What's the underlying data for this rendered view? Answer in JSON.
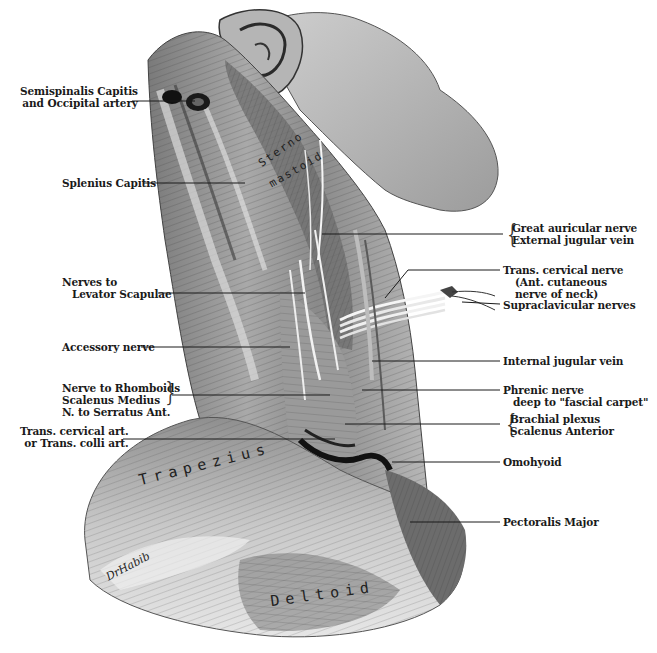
{
  "figure": {
    "signature": "DrHabib"
  },
  "left_labels": [
    {
      "id": "semispinalis",
      "lines": [
        "Semispinalis Capitis",
        "and Occipital artery"
      ]
    },
    {
      "id": "splenius",
      "lines": [
        "Splenius Capitis"
      ]
    },
    {
      "id": "levator-nerves",
      "lines": [
        "Nerves to",
        "Levator Scapulae"
      ]
    },
    {
      "id": "accessory",
      "lines": [
        "Accessory nerve"
      ]
    },
    {
      "id": "rhomboids-group",
      "lines": [
        "Nerve to Rhomboids",
        "Scalenus Medius",
        "N. to Serratus Ant."
      ]
    },
    {
      "id": "trans-cervical-art",
      "lines": [
        "Trans. cervical art.",
        "or Trans. colli art."
      ]
    }
  ],
  "right_labels": [
    {
      "id": "auricular-jugular",
      "lines": [
        "Great auricular nerve",
        "External jugular vein"
      ]
    },
    {
      "id": "trans-cervical-nerve",
      "lines": [
        "Trans. cervical nerve",
        "(Ant. cutaneous",
        "nerve of neck)"
      ]
    },
    {
      "id": "supraclavicular",
      "lines": [
        "Supraclavicular nerves"
      ]
    },
    {
      "id": "internal-jugular",
      "lines": [
        "Internal jugular vein"
      ]
    },
    {
      "id": "phrenic",
      "lines": [
        "Phrenic nerve",
        "deep to \"fascial carpet\""
      ]
    },
    {
      "id": "brachial-scalenus",
      "lines": [
        "Brachial plexus",
        "Scalenus Anterior"
      ]
    },
    {
      "id": "omohyoid",
      "lines": [
        "Omohyoid"
      ]
    },
    {
      "id": "pectoralis",
      "lines": [
        "Pectoralis Major"
      ]
    }
  ],
  "muscle_inscriptions": {
    "sterno_top": "Sterno",
    "sterno_bottom": "mastoid",
    "trapezius": "Trapezius",
    "deltoid": "Deltoid"
  },
  "colors": {
    "background": "#ffffff",
    "ink": "#1a1a1a",
    "muscle_dark": "#4a4a4a",
    "muscle_mid": "#8c8c8c",
    "muscle_light": "#d8d8d8"
  }
}
